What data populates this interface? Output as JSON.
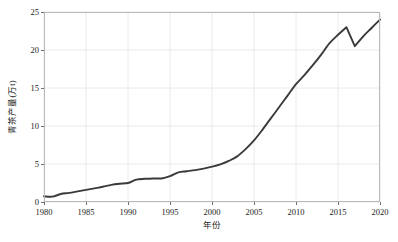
{
  "chart_data": {
    "type": "line",
    "title": "",
    "xlabel": "年份",
    "ylabel": "青茶产量(万t)",
    "xlim": [
      1980,
      2020
    ],
    "ylim": [
      0,
      25
    ],
    "grid": true,
    "legend": null,
    "line_color": "#3a3a3a",
    "grid_color": "#e4e4e4",
    "xticks": [
      1980,
      1985,
      1990,
      1995,
      2000,
      2005,
      2010,
      2015,
      2020
    ],
    "yticks": [
      0,
      5,
      10,
      15,
      20,
      25
    ],
    "x": [
      1980,
      1981,
      1982,
      1983,
      1984,
      1985,
      1986,
      1987,
      1988,
      1989,
      1990,
      1991,
      1992,
      1993,
      1994,
      1995,
      1996,
      1997,
      1998,
      1999,
      2000,
      2001,
      2002,
      2003,
      2004,
      2005,
      2006,
      2007,
      2008,
      2009,
      2010,
      2011,
      2012,
      2013,
      2014,
      2015,
      2016,
      2017,
      2018,
      2019,
      2020
    ],
    "values": [
      0.75,
      0.7,
      1.05,
      1.2,
      1.4,
      1.6,
      1.8,
      2.0,
      2.25,
      2.4,
      2.5,
      2.95,
      3.05,
      3.1,
      3.1,
      3.4,
      3.9,
      4.05,
      4.2,
      4.4,
      4.65,
      4.95,
      5.4,
      6.0,
      6.95,
      8.1,
      9.5,
      11.0,
      12.5,
      14.0,
      15.5,
      16.7,
      18.0,
      19.4,
      20.9,
      22.0,
      23.0,
      20.5,
      21.8,
      22.9,
      24.0
    ]
  }
}
